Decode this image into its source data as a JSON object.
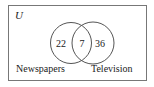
{
  "diagram": {
    "type": "venn",
    "universe_label": "U",
    "sets": [
      {
        "name": "Newspapers",
        "only_count": "22"
      },
      {
        "name": "Television",
        "only_count": "36"
      }
    ],
    "intersection_count": "7",
    "colors": {
      "stroke": "#555555",
      "text": "#222222",
      "background": "#ffffff"
    }
  }
}
